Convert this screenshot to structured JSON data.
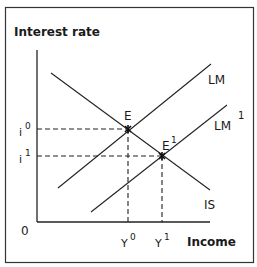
{
  "diagram": {
    "type": "IS-LM",
    "y_axis_label": "Interest rate",
    "x_axis_label": "Income",
    "origin_label": "0",
    "curves": [
      {
        "id": "IS",
        "label": "IS"
      },
      {
        "id": "LM",
        "label": "LM"
      },
      {
        "id": "LM1",
        "label": "LM",
        "superscript": "1"
      }
    ],
    "equilibria": [
      {
        "id": "E",
        "label": "E",
        "superscript": ""
      },
      {
        "id": "E1",
        "label": "E",
        "superscript": "1"
      }
    ],
    "y_ticks": [
      {
        "label": "i",
        "superscript": "0"
      },
      {
        "label": "i",
        "superscript": "1"
      }
    ],
    "x_ticks": [
      {
        "label": "Y",
        "superscript": "0"
      },
      {
        "label": "Y",
        "superscript": "1"
      }
    ]
  }
}
